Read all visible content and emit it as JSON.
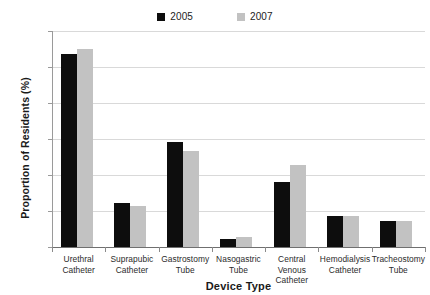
{
  "chart_data": {
    "type": "bar",
    "title": "",
    "xlabel": "Device Type",
    "ylabel": "Proportion of Residents (%)",
    "ylim": [
      0,
      0.12
    ],
    "yticks": [
      "0",
      "0.02",
      "0.04",
      "0.06",
      "0.08",
      "0.1",
      "0.12"
    ],
    "ytick_values": [
      0,
      0.02,
      0.04,
      0.06,
      0.08,
      0.1,
      0.12
    ],
    "grid": true,
    "legend_position": "top-center",
    "categories": [
      "Urethral Catheter",
      "Suprapubic Catheter",
      "Gastrostomy Tube",
      "Nasogastric Tube",
      "Central Venous Catheter",
      "Hemodialysis Catheter",
      "Tracheostomy Tube"
    ],
    "category_lines": [
      [
        "Urethral",
        "Catheter"
      ],
      [
        "Suprapubic",
        "Catheter"
      ],
      [
        "Gastrostomy",
        "Tube"
      ],
      [
        "Nasogastric",
        "Tube"
      ],
      [
        "Central Venous",
        "Catheter"
      ],
      [
        "Hemodialysis",
        "Catheter"
      ],
      [
        "Tracheostomy",
        "Tube"
      ]
    ],
    "series": [
      {
        "name": "2005",
        "color": "#0d0d0d",
        "values": [
          0.107,
          0.0242,
          0.0583,
          0.0045,
          0.0363,
          0.0175,
          0.0147
        ]
      },
      {
        "name": "2007",
        "color": "#c2c2c2",
        "values": [
          0.1098,
          0.0228,
          0.0533,
          0.0053,
          0.0456,
          0.0174,
          0.0145
        ]
      }
    ]
  },
  "legend": {
    "entries": [
      {
        "label": "2005",
        "color": "#0d0d0d"
      },
      {
        "label": "2007",
        "color": "#c2c2c2"
      }
    ]
  },
  "axes": {
    "y_title": "Proportion of Residents (%)",
    "x_title": "Device Type"
  },
  "colors": {
    "series_2005": "#0d0d0d",
    "series_2007": "#c2c2c2",
    "gridline": "#d9d9d9",
    "axis": "#8a8a8a",
    "text": "#2b2b2b",
    "background": "#ffffff"
  }
}
